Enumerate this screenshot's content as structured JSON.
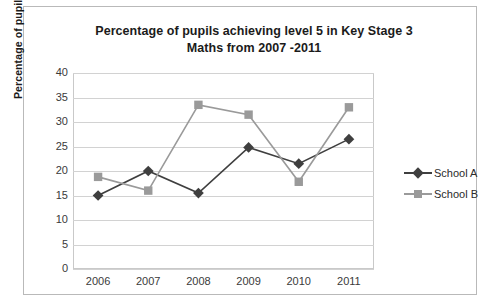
{
  "chart_data": {
    "type": "line",
    "title": "Percentage of pupils achieving level 5 in Key Stage 3 Maths from 2007 -2011",
    "title_lines": [
      "Percentage of pupils achieving level 5 in Key Stage 3",
      "Maths from 2007 -2011"
    ],
    "xlabel": "",
    "ylabel": "Percentage of pupils",
    "categories": [
      "2006",
      "2007",
      "2008",
      "2009",
      "2010",
      "2011"
    ],
    "series": [
      {
        "name": "School A",
        "values": [
          15,
          20,
          15.5,
          24.8,
          21.5,
          26.5
        ],
        "color": "#3f3f3f",
        "marker": "diamond"
      },
      {
        "name": "School B",
        "values": [
          18.8,
          16,
          33.5,
          31.5,
          17.8,
          33
        ],
        "color": "#9a9a9a",
        "marker": "square"
      }
    ],
    "ylim": [
      0,
      40
    ],
    "ytick_step": 5,
    "yticks": [
      "0",
      "5",
      "10",
      "15",
      "20",
      "25",
      "30",
      "35",
      "40"
    ],
    "grid": true,
    "legend_position": "right",
    "plot_background": "#ffffff",
    "gridline_color": "#d2d2d2",
    "border_color": "#b9b9b9"
  }
}
